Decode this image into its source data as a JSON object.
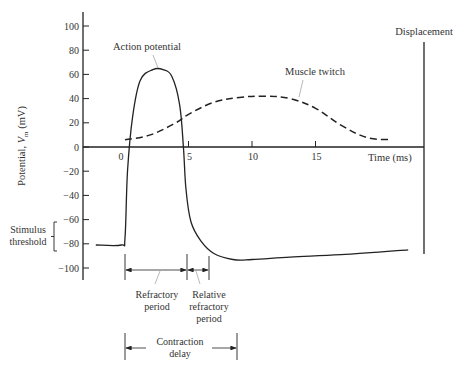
{
  "chart_data": {
    "type": "line",
    "title": "",
    "xlabel": "Time (ms)",
    "ylabel": "Potential, V_m (mV)",
    "ylabel_main": "Potential, ",
    "ylabel_var": "V",
    "ylabel_sub": "m",
    "ylabel_unit": " (mV)",
    "xlim": [
      -3,
      23
    ],
    "ylim": [
      -110,
      110
    ],
    "x_ticks": [
      0,
      5,
      10,
      15
    ],
    "x_tick_labels": [
      "0",
      "5",
      "10",
      "15"
    ],
    "y_ticks": [
      100,
      80,
      60,
      40,
      20,
      0,
      -20,
      -40,
      -60,
      -80,
      -100
    ],
    "y_tick_labels": [
      "100",
      "80",
      "60",
      "40",
      "20",
      "0",
      "−20",
      "−40",
      "−60",
      "−80",
      "−100"
    ],
    "grid": false,
    "series": [
      {
        "name": "Action potential",
        "style": "solid",
        "x": [
          -2.3,
          -0.3,
          0.0,
          0.2,
          0.6,
          1.2,
          2.2,
          3.0,
          3.7,
          4.3,
          4.6,
          4.8,
          5.2,
          6.0,
          7.0,
          8.5,
          10.0,
          13.0,
          17.0,
          22.3
        ],
        "y": [
          -81,
          -81,
          -75,
          -20,
          25,
          55,
          64,
          64,
          58,
          35,
          0,
          -35,
          -62,
          -78,
          -88,
          -93,
          -93,
          -91,
          -89,
          -85
        ]
      },
      {
        "name": "Muscle twitch",
        "style": "dashed",
        "x": [
          0,
          2,
          4,
          5,
          7,
          9,
          11,
          13,
          15,
          17,
          19,
          20.8
        ],
        "y": [
          6,
          10,
          20,
          27,
          37,
          41,
          42,
          40,
          32,
          18,
          8,
          6
        ]
      }
    ],
    "annotations": [
      {
        "text": "Action potential",
        "points_to": "Action potential peak"
      },
      {
        "text": "Muscle twitch",
        "points_to": "Muscle twitch curve"
      },
      {
        "text": "Displacement",
        "note": "secondary vertical axis for muscle twitch"
      },
      {
        "text": "Stimulus threshold",
        "range_mV": [
          -60,
          -80
        ]
      },
      {
        "text": "Refractory period",
        "from_ms": 0,
        "to_ms": 4.8
      },
      {
        "text": "Relative refractory period",
        "from_ms": 4.8,
        "to_ms": 6.5
      },
      {
        "text": "Contraction delay",
        "from_ms": 0,
        "to_ms": 8.8
      }
    ]
  },
  "labels": {
    "action_potential": "Action potential",
    "muscle_twitch": "Muscle twitch",
    "displacement": "Displacement",
    "time_axis": "Time (ms)",
    "stimulus_line1": "Stimulus",
    "stimulus_line2": "threshold",
    "refractory_line1": "Refractory",
    "refractory_line2": "period",
    "relative_line1": "Relative",
    "relative_line2": "refractory",
    "relative_line3": "period",
    "contraction_line1": "Contraction",
    "contraction_line2": "delay"
  }
}
